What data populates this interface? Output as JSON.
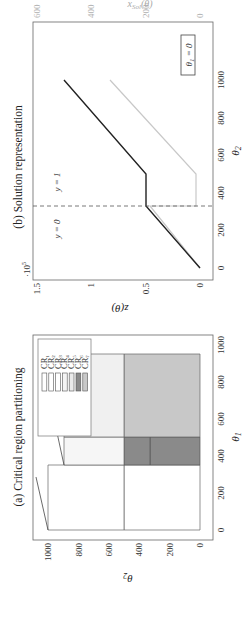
{
  "chart_data": [
    {
      "type": "area",
      "title": "(a) Critical region partitioning",
      "xlabel": "θ1",
      "ylabel": "θ2",
      "xlim": [
        0,
        1000
      ],
      "ylim": [
        0,
        1000
      ],
      "xticks": [
        "0",
        "200",
        "400",
        "600",
        "800",
        "1000"
      ],
      "yticks": [
        "0",
        "200",
        "400",
        "600",
        "800",
        "1000"
      ],
      "grid": false,
      "legend_position": "upper right",
      "regions": [
        {
          "name": "CR1",
          "fill": "#ffffff",
          "polygon": [
            [
              0,
              500
            ],
            [
              350,
              500
            ],
            [
              350,
              1000
            ],
            [
              0,
              1000
            ]
          ]
        },
        {
          "name": "CR2",
          "fill": "#ffffff",
          "polygon": [
            [
              0,
              0
            ],
            [
              350,
              0
            ],
            [
              350,
              500
            ],
            [
              0,
              500
            ]
          ]
        },
        {
          "name": "CR3",
          "fill": "#ffffff",
          "polygon": [
            [
              350,
              500
            ],
            [
              450,
              500
            ],
            [
              450,
              1000
            ],
            [
              350,
              1000
            ]
          ]
        },
        {
          "name": "CR4",
          "fill": "#f2f2f2",
          "polygon": [
            [
              350,
              500
            ],
            [
              950,
              500
            ],
            [
              950,
              1000
            ]
          ]
        },
        {
          "name": "CR5",
          "fill": "#e6e6e6",
          "polygon": [
            [
              450,
              500
            ],
            [
              950,
              1000
            ],
            [
              950,
              500
            ]
          ]
        },
        {
          "name": "CR6",
          "fill": "#8a8a8a",
          "polygon": [
            [
              350,
              330
            ],
            [
              350,
              500
            ],
            [
              500,
              500
            ],
            [
              500,
              330
            ]
          ]
        },
        {
          "name": "CR7",
          "fill": "#c8c8c8",
          "polygon": [
            [
              500,
              0
            ],
            [
              950,
              0
            ],
            [
              950,
              330
            ],
            [
              500,
              330
            ]
          ]
        }
      ],
      "legend": [
        "CR1",
        "CR2",
        "CR3",
        "CR4",
        "CR5",
        "CR6",
        "CR7"
      ]
    },
    {
      "type": "line",
      "title": "(b) Solution representation",
      "xlabel": "θ2",
      "ylabel": "z(θ)",
      "ylabel_right": "x_Sol(θ)",
      "xlim": [
        -60,
        1080
      ],
      "ylim": [
        -0.1,
        1.5
      ],
      "ylim_right": [
        0,
        600
      ],
      "y_scale_note": "·10^5",
      "xticks": [
        "0",
        "200",
        "400",
        "600",
        "800",
        "1000"
      ],
      "yticks": [
        "0",
        "0.5",
        "1",
        "1.5"
      ],
      "yticks_right": [
        "0",
        "200",
        "400",
        "600"
      ],
      "annotations": [
        "y = 0",
        "y = 1",
        "θ1 = 0"
      ],
      "vline_x": 330,
      "series": [
        {
          "name": "z(θ)",
          "color": "#222222",
          "x": [
            0,
            330,
            500,
            1000
          ],
          "y": [
            0,
            0.5,
            0.5,
            1.25
          ]
        },
        {
          "name": "x_Sol(θ) (right axis)",
          "color": "#c8c8c8",
          "x": [
            0,
            330,
            330,
            500,
            1000
          ],
          "y_right": [
            0,
            270,
            30,
            30,
            530
          ]
        }
      ]
    }
  ],
  "panel_a": {
    "title": "(a) Critical region partitioning",
    "xlabel": "θ",
    "xlabel_sub": "1",
    "ylabel": "θ",
    "ylabel_sub": "2",
    "xticks": [
      "0",
      "200",
      "400",
      "600",
      "800",
      "1000"
    ],
    "yticks": [
      "0",
      "200",
      "400",
      "600",
      "800",
      "1000"
    ],
    "legend": [
      {
        "label": "CR",
        "sub": "1",
        "fill": "#ffffff"
      },
      {
        "label": "CR",
        "sub": "2",
        "fill": "#ffffff"
      },
      {
        "label": "CR",
        "sub": "3",
        "fill": "#ffffff"
      },
      {
        "label": "CR",
        "sub": "4",
        "fill": "#f4f4f4"
      },
      {
        "label": "CR",
        "sub": "5",
        "fill": "#eaeaea"
      },
      {
        "label": "CR",
        "sub": "6",
        "fill": "#8a8a8a"
      },
      {
        "label": "CR",
        "sub": "7",
        "fill": "#c8c8c8"
      }
    ]
  },
  "panel_b": {
    "title": "(b) Solution representation",
    "xlabel": "θ",
    "xlabel_sub": "2",
    "ylabel": "z(θ)",
    "ylabel_right": "x",
    "ylabel_right_sub": "Sol",
    "ylabel_right_tail": "(θ)",
    "scale_note": "·10",
    "scale_exp": "5",
    "xticks": [
      "0",
      "200",
      "400",
      "600",
      "800",
      "1000"
    ],
    "yticks": [
      "0",
      "0.5",
      "1",
      "1.5"
    ],
    "yticks_right": [
      "0",
      "200",
      "400",
      "600"
    ],
    "annot_y0": "y = 0",
    "annot_y1": "y = 1",
    "box_label": "θ",
    "box_sub": "1",
    "box_tail": " = 0"
  },
  "colors": {
    "axis": "#555555",
    "dark_line": "#222222",
    "light_line": "#c8c8c8",
    "cr6": "#8a8a8a",
    "cr7": "#c8c8c8"
  }
}
